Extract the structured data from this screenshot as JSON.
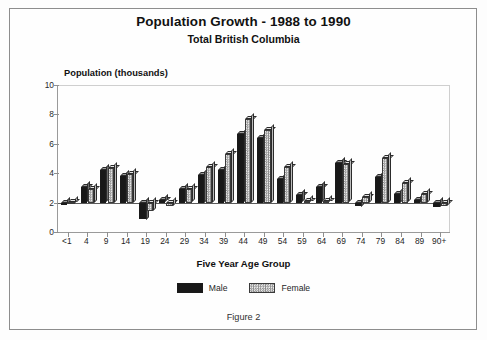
{
  "figure": {
    "caption": "Figure 2"
  },
  "title": {
    "main": "Population Growth - 1988 to 1990",
    "sub": "Total British Columbia"
  },
  "legend": {
    "male_label": "Male",
    "female_label": "Female",
    "male_color": "#181818",
    "female_color": "#e8e8e8"
  },
  "chart_data": {
    "type": "bar",
    "subtitle": "Total British Columbia",
    "xlabel": "Five Year Age Group",
    "ylabel": "Population (thousands)",
    "ylim": [
      0,
      10
    ],
    "yticks": [
      0,
      2,
      4,
      6,
      8,
      10
    ],
    "baseline": 2,
    "grid": false,
    "legend_position": "bottom-center",
    "categories": [
      "<1",
      "4",
      "9",
      "14",
      "19",
      "24",
      "29",
      "34",
      "39",
      "44",
      "49",
      "54",
      "59",
      "64",
      "69",
      "74",
      "79",
      "84",
      "89",
      "90+"
    ],
    "series": [
      {
        "name": "Male",
        "values": [
          1.9,
          3.05,
          4.2,
          3.8,
          0.85,
          2.15,
          2.9,
          3.9,
          4.2,
          6.65,
          6.4,
          3.6,
          2.5,
          3.05,
          4.7,
          1.75,
          3.75,
          2.6,
          2.2,
          1.7
        ]
      },
      {
        "name": "Female",
        "values": [
          2.05,
          2.95,
          4.35,
          3.95,
          1.45,
          1.8,
          2.9,
          4.45,
          5.3,
          7.7,
          6.95,
          4.45,
          2.1,
          2.1,
          4.6,
          2.4,
          5.05,
          3.3,
          2.6,
          1.8
        ]
      }
    ]
  }
}
